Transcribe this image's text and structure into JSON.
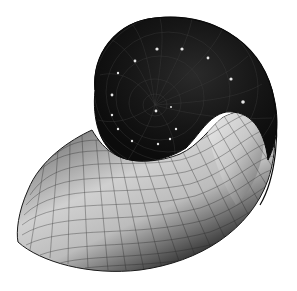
{
  "image": {
    "subject": "nautilus-shell",
    "description": "Rendered nautilus shell spiral with mesh grid lines",
    "width": 297,
    "height": 291,
    "colors": {
      "background": "#ffffff",
      "shell_dark": "#141414",
      "shell_mid": "#3a3a3a",
      "shell_light": "#d8d8d8",
      "grid_line": "#1a1a1a",
      "highlight_dots": "#e8e8e8"
    }
  }
}
